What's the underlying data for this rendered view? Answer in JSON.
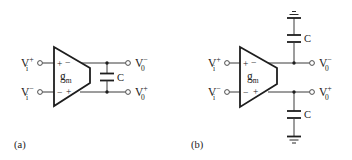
{
  "figure": {
    "panels": [
      {
        "id": "a",
        "label": "(a)",
        "amplifier": {
          "symbol": "g",
          "subscript": "m",
          "top_inputs": [
            "+",
            "−"
          ],
          "bottom_inputs": [
            "−",
            "+"
          ]
        },
        "inputs": [
          {
            "base": "V",
            "sub": "i",
            "sup": "+"
          },
          {
            "base": "V",
            "sub": "i",
            "sup": "−"
          }
        ],
        "outputs": [
          {
            "base": "V",
            "sub": "0",
            "sup": "−"
          },
          {
            "base": "V",
            "sub": "0",
            "sup": "+"
          }
        ],
        "capacitors": [
          {
            "label": "C",
            "connection": "differential between outputs"
          }
        ]
      },
      {
        "id": "b",
        "label": "(b)",
        "amplifier": {
          "symbol": "g",
          "subscript": "m",
          "top_inputs": [
            "+",
            "−"
          ],
          "bottom_inputs": [
            "−",
            "+"
          ]
        },
        "inputs": [
          {
            "base": "V",
            "sub": "i",
            "sup": "+"
          },
          {
            "base": "V",
            "sub": "i",
            "sup": "−"
          }
        ],
        "outputs": [
          {
            "base": "V",
            "sub": "0",
            "sup": "−"
          },
          {
            "base": "V",
            "sub": "0",
            "sup": "+"
          }
        ],
        "capacitors": [
          {
            "label": "C",
            "connection": "top output to ground"
          },
          {
            "label": "C",
            "connection": "bottom output to ground"
          }
        ]
      }
    ],
    "colors": {
      "ink": "#1e1e1e",
      "background": "#ffffff"
    }
  }
}
